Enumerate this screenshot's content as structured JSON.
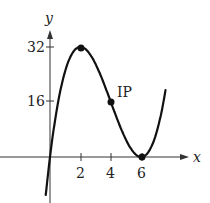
{
  "chart_data": {
    "type": "line",
    "title": "",
    "xlabel": "x",
    "ylabel": "y",
    "x_ticks": [
      "2",
      "4",
      "6"
    ],
    "y_ticks": [
      "16",
      "32"
    ],
    "function": "y = x^3 - 12x^2 + 36x",
    "series": [
      {
        "name": "f(x)",
        "x": [
          -0.3,
          0,
          0.5,
          1,
          1.5,
          2,
          2.5,
          3,
          3.5,
          4,
          4.5,
          5,
          5.5,
          6,
          6.5,
          7,
          7.5
        ],
        "y": [
          -11.9,
          0,
          15.1,
          25,
          30.4,
          32,
          30.6,
          27,
          21.9,
          16,
          10.1,
          5,
          1.4,
          0,
          3.1,
          7,
          16.9
        ]
      }
    ],
    "points": [
      {
        "x": 2,
        "y": 32,
        "label": ""
      },
      {
        "x": 4,
        "y": 16,
        "label": "IP"
      },
      {
        "x": 6,
        "y": 0,
        "label": ""
      }
    ],
    "xlim": [
      -0.5,
      8
    ],
    "ylim": [
      -14,
      40
    ],
    "grid": false,
    "legend": "none"
  },
  "labels": {
    "x_axis": "x",
    "y_axis": "y",
    "tick_x_2": "2",
    "tick_x_4": "4",
    "tick_x_6": "6",
    "tick_y_16": "16",
    "tick_y_32": "32",
    "inflection": "IP"
  }
}
